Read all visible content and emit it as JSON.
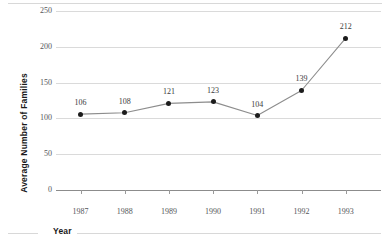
{
  "chart_data": {
    "type": "line",
    "title": "",
    "xlabel": "Year",
    "ylabel": "Average Number of Families",
    "categories": [
      "1987",
      "1988",
      "1989",
      "1990",
      "1991",
      "1992",
      "1993"
    ],
    "x": [
      1987,
      1988,
      1989,
      1990,
      1991,
      1992,
      1993
    ],
    "values": [
      106,
      108,
      121,
      123,
      104,
      139,
      212
    ],
    "point_labels": [
      "106",
      "108",
      "121",
      "123",
      "104",
      "139",
      "212"
    ],
    "ylim": [
      0,
      250
    ],
    "yticks": [
      0,
      50,
      100,
      150,
      200,
      250
    ],
    "ytick_labels": [
      "0",
      "50",
      "100",
      "150",
      "200",
      "250"
    ],
    "grid": true,
    "grid_axis": "y",
    "legend": "none",
    "series": [
      {
        "name": "Average Number of Families",
        "values": [
          106,
          108,
          121,
          123,
          104,
          139,
          212
        ],
        "line_color": "#8d8d8d",
        "marker_color": "#1c1c1c",
        "marker": "circle"
      }
    ],
    "colors": {
      "line": "#8d8d8d",
      "marker": "#1c1c1c",
      "grid": "#dadada",
      "axis": "#8c8c8c",
      "tick_text": "#55565a",
      "title_text": "#1a1a1a",
      "label_text": "#3b3b3b",
      "background": "#ffffff",
      "frame": "#d8d8d8"
    }
  }
}
